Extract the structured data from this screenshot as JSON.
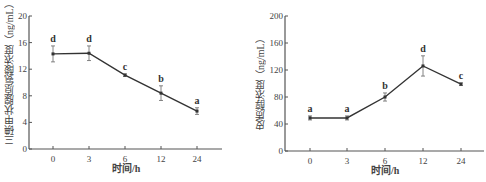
{
  "chart_data": [
    {
      "type": "line",
      "title": "",
      "xlabel": "时间/h",
      "ylabel": "三碘甲状腺原氨酸浓度（ng/mL）",
      "categories": [
        "0",
        "3",
        "6",
        "12",
        "24"
      ],
      "series": [
        {
          "name": "三碘甲状腺原氨酸浓度",
          "values": [
            14.3,
            14.4,
            11.1,
            8.4,
            5.7
          ],
          "error": [
            1.2,
            1.1,
            0.2,
            1.1,
            0.5
          ],
          "significance": [
            "d",
            "d",
            "c",
            "b",
            "a"
          ]
        }
      ],
      "yticks": [
        "0",
        "4",
        "8",
        "12",
        "16",
        "20"
      ],
      "ylim": [
        0,
        20
      ],
      "grid": false,
      "legend": "none"
    },
    {
      "type": "line",
      "title": "",
      "xlabel": "时间/h",
      "ylabel": "皮质醇浓度（ng/mL）",
      "categories": [
        "0",
        "3",
        "6",
        "12",
        "24"
      ],
      "series": [
        {
          "name": "皮质醇浓度",
          "values": [
            49,
            49,
            80,
            126,
            99
          ],
          "error": [
            3,
            3,
            6,
            15,
            2
          ],
          "significance": [
            "a",
            "a",
            "b",
            "d",
            "c"
          ]
        }
      ],
      "yticks": [
        "0",
        "40",
        "80",
        "120",
        "160",
        "200"
      ],
      "ylim": [
        0,
        200
      ],
      "grid": false,
      "legend": "none"
    }
  ]
}
